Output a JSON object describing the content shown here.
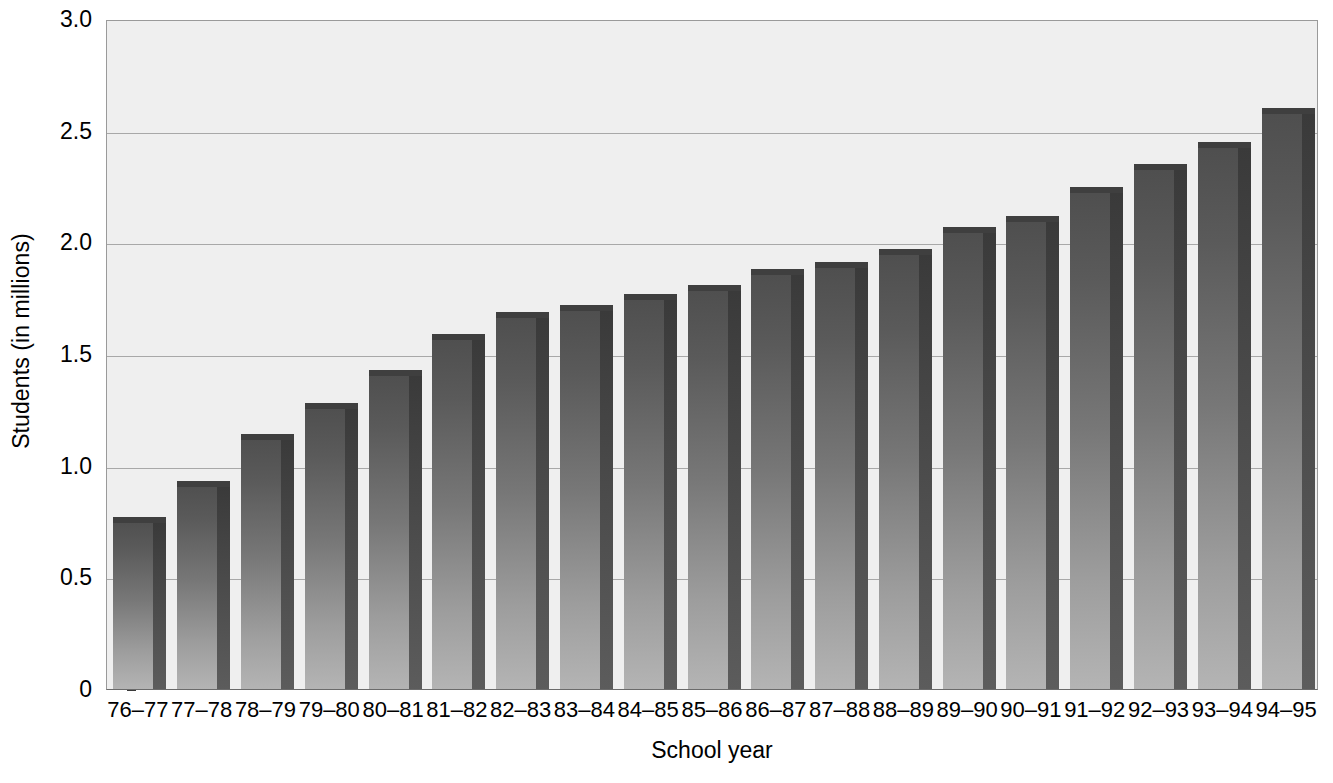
{
  "chart_data": {
    "type": "bar",
    "title": "",
    "xlabel": "School year",
    "ylabel": "Students (in millions)",
    "categories": [
      "76–77",
      "77–78",
      "78–79",
      "79–80",
      "80–81",
      "81–82",
      "82–83",
      "83–84",
      "84–85",
      "85–86",
      "86–87",
      "87–88",
      "88–89",
      "89–90",
      "90–91",
      "91–92",
      "92–93",
      "93–94",
      "94–95"
    ],
    "values": [
      0.77,
      0.93,
      1.14,
      1.28,
      1.43,
      1.59,
      1.69,
      1.72,
      1.77,
      1.81,
      1.88,
      1.91,
      1.97,
      2.07,
      2.12,
      2.25,
      2.35,
      2.45,
      2.6
    ],
    "ylim": [
      0,
      3.0
    ],
    "ytick_labels": [
      "3.0",
      "2.5",
      "2.0",
      "1.5",
      "1.0",
      "0.5",
      "0"
    ],
    "ytick_values": [
      3.0,
      2.5,
      2.0,
      1.5,
      1.0,
      0.5,
      0
    ],
    "grid": true,
    "gridlines_at": [
      2.5,
      2.0,
      1.5,
      1.0,
      0.5
    ],
    "legend": [],
    "legend_position": "none",
    "series": [
      {
        "name": "Students (in millions)",
        "values": [
          0.77,
          0.93,
          1.14,
          1.28,
          1.43,
          1.59,
          1.69,
          1.72,
          1.77,
          1.81,
          1.88,
          1.91,
          1.97,
          2.07,
          2.12,
          2.25,
          2.35,
          2.45,
          2.6
        ]
      }
    ],
    "colors": {
      "plot_background": "#efefef",
      "page_background": "#ffffff",
      "bar_front_top": "#4e4e4e",
      "bar_front_bottom": "#b4b4b4",
      "bar_side": "#434343",
      "gridline": "#a8a8a8",
      "axis": "#6b6b6b",
      "text": "#000000"
    }
  }
}
